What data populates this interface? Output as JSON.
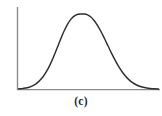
{
  "figure": {
    "caption": "(c)",
    "axis_color": "#8c8c8c",
    "curve_color": "#2e2e2e",
    "background_color": "#ffffff",
    "caption_color": "#2a2a2a"
  },
  "chart_data": {
    "type": "line",
    "title": "",
    "subtitle": "",
    "xlabel": "",
    "ylabel": "",
    "annotations": [
      "(c)"
    ],
    "legend": [],
    "legend_position": "none",
    "grid": false,
    "axis_ticks": false,
    "tick_labels": {
      "x": [],
      "y": []
    },
    "xlim": [
      0,
      10
    ],
    "ylim": [
      0,
      1
    ],
    "series": [
      {
        "name": "normal-curve",
        "mean": 4.7,
        "std": 1.5,
        "peak": 1.0,
        "x": [
          0.0,
          0.25,
          0.5,
          0.75,
          1.0,
          1.25,
          1.5,
          1.75,
          2.0,
          2.25,
          2.5,
          2.75,
          3.0,
          3.25,
          3.5,
          3.75,
          4.0,
          4.25,
          4.5,
          4.7,
          4.9,
          5.15,
          5.4,
          5.65,
          5.9,
          6.15,
          6.4,
          6.65,
          6.9,
          7.15,
          7.4,
          7.65,
          7.9,
          8.15,
          8.4,
          8.65,
          8.9,
          9.15,
          9.4,
          9.65,
          10.0
        ],
        "y": [
          0.004,
          0.008,
          0.015,
          0.026,
          0.044,
          0.071,
          0.111,
          0.165,
          0.236,
          0.324,
          0.429,
          0.544,
          0.661,
          0.77,
          0.863,
          0.932,
          0.974,
          0.997,
          1.0,
          1.0,
          0.991,
          0.963,
          0.914,
          0.846,
          0.764,
          0.671,
          0.574,
          0.477,
          0.386,
          0.303,
          0.232,
          0.172,
          0.124,
          0.087,
          0.059,
          0.039,
          0.025,
          0.016,
          0.01,
          0.006,
          0.003
        ]
      }
    ]
  }
}
